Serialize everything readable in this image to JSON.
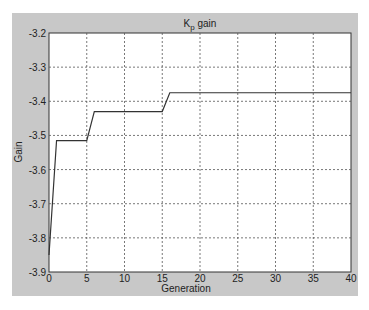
{
  "chart_data": {
    "type": "line",
    "title": "Kp gain",
    "title_main": "K",
    "title_sub": "p",
    "title_rest": " gain",
    "xlabel": "Generation",
    "ylabel": "Gain",
    "xlim": [
      0,
      40
    ],
    "ylim": [
      -3.9,
      -3.2
    ],
    "xticks": [
      "0",
      "5",
      "10",
      "15",
      "20",
      "25",
      "30",
      "35",
      "40"
    ],
    "yticks": [
      "-3.2",
      "-3.3",
      "-3.4",
      "-3.5",
      "-3.6",
      "-3.7",
      "-3.8",
      "-3.9"
    ],
    "grid": true,
    "series": [
      {
        "name": "Kp gain",
        "x": [
          0,
          1,
          5,
          6,
          15,
          16,
          40
        ],
        "y": [
          -3.85,
          -3.515,
          -3.515,
          -3.43,
          -3.43,
          -3.375,
          -3.375
        ]
      }
    ]
  }
}
